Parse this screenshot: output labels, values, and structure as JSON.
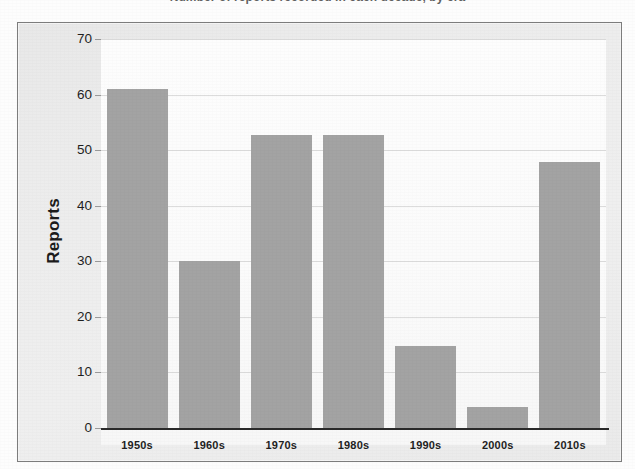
{
  "page": {
    "background_color": "#fdfdfd",
    "clipped_title": "Number of reports recorded in each decade, by era"
  },
  "chart_frame": {
    "border_color": "#7d7d7d",
    "panel_color": "#ececec",
    "plot_background": "#fdfdfd"
  },
  "chart_data": {
    "type": "bar",
    "title": "",
    "xlabel": "",
    "ylabel": "Reports",
    "categories": [
      "1950s",
      "1960s",
      "1970s",
      "1980s",
      "1990s",
      "2000s",
      "2010s"
    ],
    "values": [
      61,
      30,
      52.7,
      52.7,
      14.8,
      3.8,
      47.8
    ],
    "ylim": [
      0,
      70
    ],
    "ytick_labels": [
      "70",
      "60",
      "50",
      "40",
      "30",
      "20",
      "10",
      "0"
    ],
    "ytick_values": [
      70,
      60,
      50,
      40,
      30,
      20,
      10,
      0
    ],
    "ytick_step": 10,
    "grid": true,
    "grid_axis": "y",
    "grid_color": "#dcdcdc",
    "legend": false,
    "legend_position": "none",
    "bar_color": "#a3a3a3",
    "axis_line_color": "#2a2a2a",
    "series": [
      {
        "name": "Reports",
        "values": [
          61,
          30,
          52.7,
          52.7,
          14.8,
          3.8,
          47.8
        ]
      }
    ]
  }
}
